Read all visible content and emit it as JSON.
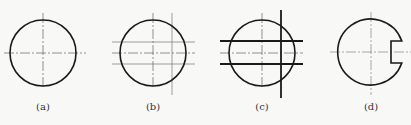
{
  "figure": {
    "panels": [
      {
        "id": "a",
        "label": "(a)",
        "cx": 43,
        "cy": 53
      },
      {
        "id": "b",
        "label": "(b)",
        "cx": 153,
        "cy": 53
      },
      {
        "id": "c",
        "label": "(c)",
        "cx": 262,
        "cy": 53
      },
      {
        "id": "d",
        "label": "(d)",
        "cx": 371,
        "cy": 52
      }
    ],
    "colors": {
      "stroke": "#1a1a1a",
      "thin": "#555555",
      "background": "#f8f8f6"
    }
  }
}
